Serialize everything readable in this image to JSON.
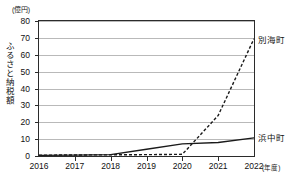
{
  "chart_data": {
    "type": "line",
    "title": "",
    "subtitle": "",
    "xlabel": "(年度)",
    "ylabel": "ふるさと納税額",
    "yunit": "(億円)",
    "ylim": [
      0,
      80
    ],
    "ytick_step": 10,
    "yticks": [
      "80",
      "70",
      "60",
      "50",
      "40",
      "30",
      "20",
      "10",
      "0"
    ],
    "grid": true,
    "legend_position": "right-inline",
    "categories": [
      "2016",
      "2017",
      "2018",
      "2019",
      "2020",
      "2021",
      "2022"
    ],
    "x": [
      2016,
      2017,
      2018,
      2019,
      2020,
      2021,
      2022
    ],
    "series": [
      {
        "name": "別海町",
        "style": "dashed",
        "color": "#1a1a1a",
        "values": [
          0.5,
          0.6,
          0.7,
          0.8,
          1.0,
          24.0,
          69.5
        ],
        "label_text": "別海町"
      },
      {
        "name": "浜中町",
        "style": "solid",
        "color": "#1a1a1a",
        "values": [
          0.4,
          0.5,
          0.8,
          4.0,
          7.2,
          8.0,
          10.8
        ],
        "label_text": "浜中町"
      }
    ],
    "annotations": []
  },
  "axis": {
    "y_unit_label": "(億円)",
    "y_title": "ふるさと納税額",
    "x_unit_label": "(年度)"
  }
}
